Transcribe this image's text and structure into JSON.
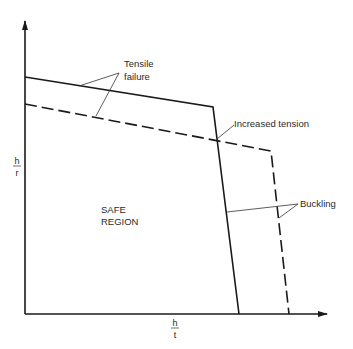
{
  "diagram": {
    "axes": {
      "x_label_num": "h",
      "x_label_den": "t",
      "y_label_num": "h",
      "y_label_den": "r"
    },
    "labels": {
      "tensile_1": "Tensile",
      "tensile_2": "failure",
      "increased_tension": "Increased tension",
      "buckling": "Buckling",
      "safe_1": "SAFE",
      "safe_2": "REGION"
    },
    "curves": [
      {
        "name": "original",
        "style": "solid",
        "points": [
          [
            25,
            77
          ],
          [
            213,
            107
          ],
          [
            239,
            314
          ]
        ]
      },
      {
        "name": "increased-tension",
        "style": "dashed",
        "points": [
          [
            25,
            104
          ],
          [
            271,
            151
          ],
          [
            289,
            314
          ]
        ]
      }
    ],
    "colors": {
      "line": "#1a1a1a",
      "text": "#2a2a2a",
      "background": "#ffffff"
    }
  }
}
